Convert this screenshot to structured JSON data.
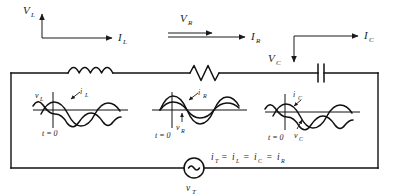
{
  "figure": {
    "type": "circuit-diagram"
  },
  "top_arrows": {
    "inductor": {
      "voltage_label": "V",
      "voltage_sub": "L",
      "voltage_direction": "up",
      "current_label": "I",
      "current_sub": "L",
      "current_direction": "right"
    },
    "resistor": {
      "voltage_label": "V",
      "voltage_sub": "R",
      "voltage_direction": "right",
      "voltage_style": "double-line-arrow",
      "current_label": "I",
      "current_sub": "R",
      "current_direction": "right"
    },
    "capacitor": {
      "voltage_label": "V",
      "voltage_sub": "C",
      "voltage_direction": "down",
      "current_label": "I",
      "current_sub": "C",
      "current_direction": "right"
    }
  },
  "components": [
    {
      "name": "inductor",
      "symbol": "coil",
      "coils": 4
    },
    {
      "name": "resistor",
      "symbol": "zigzag",
      "peaks": 3
    },
    {
      "name": "capacitor",
      "symbol": "parallel-plates",
      "plates": 2
    },
    {
      "name": "ac-source",
      "symbol": "circle-tilde",
      "label": "v",
      "label_sub": "T"
    }
  ],
  "waveform_panels": [
    {
      "id": "inductor-waveforms",
      "voltage_label": "v",
      "voltage_sub": "L",
      "current_label": "i",
      "current_sub": "L",
      "time_label": "t = 0",
      "phase_note": "voltage leads current by 90 degrees"
    },
    {
      "id": "resistor-waveforms",
      "voltage_label": "v",
      "voltage_sub": "R",
      "current_label": "i",
      "current_sub": "R",
      "time_label": "t = 0",
      "phase_note": "voltage and current in phase"
    },
    {
      "id": "capacitor-waveforms",
      "voltage_label": "v",
      "voltage_sub": "C",
      "current_label": "i",
      "current_sub": "C",
      "time_label": "t = 0",
      "phase_note": "current leads voltage by 90 degrees"
    }
  ],
  "equation": {
    "text": "i",
    "full": "iT = iL = iC = iR",
    "terms": [
      {
        "base": "i",
        "sub": "T"
      },
      {
        "base": "i",
        "sub": "L"
      },
      {
        "base": "i",
        "sub": "C"
      },
      {
        "base": "i",
        "sub": "R"
      }
    ],
    "operator": "="
  },
  "source": {
    "label": "v",
    "label_sub": "T",
    "glyph": "~"
  },
  "colors": {
    "ink": "#111111",
    "background": "#ffffff"
  }
}
